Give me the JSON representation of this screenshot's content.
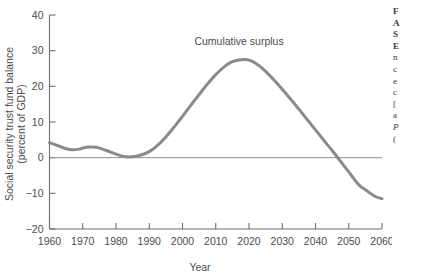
{
  "chart_data": {
    "type": "line",
    "title": "",
    "xlabel": "Year",
    "ylabel": "Social security trust fund balance (percent of GDP)",
    "ylabel_line1": "Social security trust fund balance",
    "ylabel_line2": "(percent of GDP)",
    "xlim": [
      1960,
      2060
    ],
    "ylim": [
      -20,
      40
    ],
    "xticks": [
      1960,
      1970,
      1980,
      1990,
      2000,
      2010,
      2020,
      2030,
      2040,
      2050,
      2060
    ],
    "xtick_labels": [
      "1960",
      "1970",
      "1980",
      "1990",
      "2000",
      "2010",
      "2020",
      "2030",
      "2040",
      "2050",
      "2060"
    ],
    "yticks": [
      40,
      30,
      20,
      10,
      0,
      -10,
      -20
    ],
    "ytick_labels": [
      "40",
      "30",
      "20",
      "10",
      "0",
      "−10",
      "−20"
    ],
    "grid": false,
    "legend": "none",
    "zero_line": true,
    "series": [
      {
        "name": "Cumulative surplus",
        "color": "#8a8a8a",
        "x": [
          1960,
          1963,
          1965,
          1967,
          1969,
          1970,
          1972,
          1974,
          1976,
          1978,
          1980,
          1982,
          1984,
          1986,
          1988,
          1990,
          1992,
          1995,
          1998,
          2000,
          2003,
          2005,
          2008,
          2010,
          2013,
          2015,
          2017,
          2019,
          2021,
          2023,
          2025,
          2028,
          2030,
          2033,
          2035,
          2038,
          2040,
          2043,
          2045,
          2048,
          2050,
          2053,
          2055,
          2058,
          2060
        ],
        "values": [
          4.2,
          3.2,
          2.5,
          2.2,
          2.4,
          2.7,
          3.0,
          2.9,
          2.4,
          1.7,
          1.0,
          0.4,
          0.2,
          0.4,
          0.9,
          1.7,
          3.0,
          5.8,
          9.2,
          11.6,
          15.3,
          17.7,
          21.2,
          23.3,
          25.8,
          26.9,
          27.4,
          27.5,
          27.0,
          25.8,
          24.2,
          21.3,
          19.2,
          15.9,
          13.6,
          10.1,
          7.8,
          4.3,
          2.0,
          -1.6,
          -4.0,
          -7.6,
          -9.0,
          -10.9,
          -11.5
        ]
      }
    ],
    "annotations": [
      {
        "text": "Cumulative surplus",
        "x": 2017,
        "y": 31.5
      }
    ]
  },
  "caption": {
    "lines": [
      {
        "text": "F",
        "style": "bold"
      },
      {
        "text": "A",
        "style": "bold"
      },
      {
        "text": "S",
        "style": "bold"
      },
      {
        "text": "E",
        "style": "bold"
      },
      {
        "text": "n",
        "style": "normal"
      },
      {
        "text": "c",
        "style": "normal"
      },
      {
        "text": "e",
        "style": "normal"
      },
      {
        "text": "c",
        "style": "normal"
      },
      {
        "text": "[",
        "style": "normal"
      },
      {
        "text": "a",
        "style": "normal"
      },
      {
        "text": "P",
        "style": "italic"
      },
      {
        "text": "(",
        "style": "normal"
      }
    ]
  }
}
